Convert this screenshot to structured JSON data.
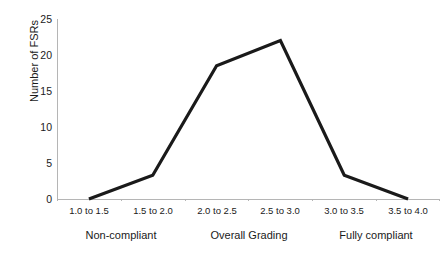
{
  "chart_data": {
    "type": "line",
    "title": "",
    "subtitle": "",
    "xlabel": "",
    "ylabel": "Number of FSRs",
    "categories": [
      "1.0 to 1.5",
      "1.5 to 2.0",
      "2.0 to 2.5",
      "2.5 to 3.0",
      "3.0 to 3.5",
      "3.5 to 4.0"
    ],
    "values": [
      0,
      3.3,
      18.5,
      22,
      3.3,
      0
    ],
    "ylim": [
      0,
      25
    ],
    "yticks": [
      0,
      5,
      10,
      15,
      20,
      25
    ],
    "ytick_labels": [
      "0",
      "5",
      "10",
      "15",
      "20",
      "25"
    ],
    "grid": false,
    "legend": "none",
    "line_color": "#1a1a1a",
    "axis_color": "#b5b5b5",
    "background_color": "#ffffff",
    "group_labels": [
      {
        "label": "Non-compliant",
        "spans": [
          "1.0 to 1.5",
          "1.5 to 2.0"
        ]
      },
      {
        "label": "Overall Grading",
        "spans": [
          "2.0 to 2.5",
          "2.5 to 3.0"
        ]
      },
      {
        "label": "Fully compliant",
        "spans": [
          "3.0 to 3.5",
          "3.5 to 4.0"
        ]
      }
    ]
  }
}
